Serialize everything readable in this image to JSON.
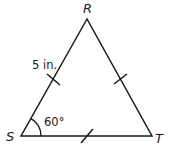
{
  "figure": {
    "type": "triangle",
    "vertices": [
      {
        "name": "R",
        "x": 87,
        "y": 19
      },
      {
        "name": "S",
        "x": 21,
        "y": 136
      },
      {
        "name": "T",
        "x": 152,
        "y": 136
      }
    ],
    "labels": {
      "vertex_r": "R",
      "vertex_s": "S",
      "vertex_t": "T",
      "side_sr_length": "5 in.",
      "angle_s": "60°"
    },
    "congruence_marks": [
      "SR",
      "RT",
      "ST"
    ],
    "stroke_color": "#1a1a1a",
    "background": "#ffffff"
  }
}
